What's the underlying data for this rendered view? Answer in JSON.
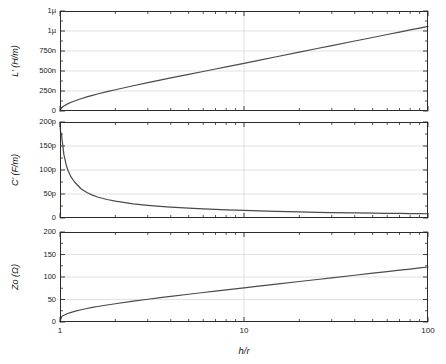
{
  "chart_data": {
    "type": "line",
    "title": "",
    "xlabel": "h/r",
    "xscale": "log",
    "xlim": [
      1,
      100
    ],
    "xticks": [
      1,
      10,
      100
    ],
    "xticklabels": [
      "1",
      "10",
      "100"
    ],
    "grid": true,
    "panels": [
      {
        "id": "panel-inductance",
        "ylabel": "L' (H/m)",
        "ylim": [
          0,
          1.25e-06
        ],
        "yticks": [
          0,
          2.5e-07,
          5e-07,
          7.5e-07,
          1e-06,
          1.25e-06
        ],
        "yticklabels": [
          "0",
          "250n",
          "500n",
          "750n",
          "1µ",
          "1µ"
        ],
        "series": [
          {
            "name": "L'",
            "color": "#4a4a4a",
            "x": [
              1.0,
              1.02,
              1.05,
              1.1,
              1.15,
              1.2,
              1.3,
              1.4,
              1.5,
              1.6,
              1.8,
              2.0,
              2.5,
              3.0,
              3.5,
              4.0,
              5.0,
              6.0,
              7.0,
              8.0,
              10.0,
              12.0,
              15.0,
              20.0,
              25.0,
              30.0,
              40.0,
              50.0,
              60.0,
              70.0,
              80.0,
              90.0,
              100.0
            ],
            "y": [
              0,
              4e-08,
              6.3e-08,
              8.9e-08,
              1.09e-07,
              1.25e-07,
              1.53e-07,
              1.76e-07,
              1.96e-07,
              2.13e-07,
              2.42e-07,
              2.66e-07,
              3.16e-07,
              3.55e-07,
              3.86e-07,
              4.13e-07,
              4.58e-07,
              4.94e-07,
              5.25e-07,
              5.51e-07,
              5.96e-07,
              6.33e-07,
              6.78e-07,
              7.36e-07,
              7.81e-07,
              8.17e-07,
              8.75e-07,
              9.19e-07,
              9.56e-07,
              9.86e-07,
              1.013e-06,
              1.036e-06,
              1.057e-06
            ]
          }
        ]
      },
      {
        "id": "panel-capacitance",
        "ylabel": "C' (F/m)",
        "ylim": [
          0,
          2e-10
        ],
        "yticks": [
          0,
          5e-11,
          1e-10,
          1.5e-10,
          2e-10
        ],
        "yticklabels": [
          "0",
          "50p",
          "100p",
          "150p",
          "200p"
        ],
        "series": [
          {
            "name": "C'",
            "color": "#4a4a4a",
            "x": [
              1.0,
              1.005,
              1.01,
              1.02,
              1.03,
              1.05,
              1.08,
              1.1,
              1.15,
              1.2,
              1.3,
              1.4,
              1.5,
              1.6,
              1.8,
              2.0,
              2.5,
              3.0,
              3.5,
              4.0,
              5.0,
              6.0,
              7.0,
              8.0,
              10.0,
              12.0,
              15.0,
              20.0,
              25.0,
              30.0,
              40.0,
              50.0,
              60.0,
              70.0,
              80.0,
              90.0,
              100.0
            ],
            "y": [
              2e-10,
              1.82e-10,
              1.78e-10,
              1.73e-10,
              1.58e-10,
              1.32e-10,
              1.11e-10,
              1.01e-10,
              8.5e-11,
              7.5e-11,
              6.1e-11,
              5.3e-11,
              4.77e-11,
              4.38e-11,
              3.85e-11,
              3.5e-11,
              2.95e-11,
              2.63e-11,
              2.41e-11,
              2.26e-11,
              2.04e-11,
              1.89e-11,
              1.78e-11,
              1.69e-11,
              1.57e-11,
              1.47e-11,
              1.38e-11,
              1.27e-11,
              1.19e-11,
              1.14e-11,
              1.07e-11,
              1.01e-11,
              9.75e-12,
              9.45e-12,
              9.2e-12,
              9e-12,
              8.82e-12
            ]
          }
        ]
      },
      {
        "id": "panel-impedance",
        "ylabel": "Zo (Ω)",
        "ylim": [
          0,
          200
        ],
        "yticks": [
          0,
          50,
          100,
          150,
          200
        ],
        "yticklabels": [
          "0",
          "50",
          "100",
          "150",
          "200"
        ],
        "series": [
          {
            "name": "Zo",
            "color": "#4a4a4a",
            "x": [
              1.0,
              1.02,
              1.05,
              1.1,
              1.15,
              1.2,
              1.3,
              1.4,
              1.5,
              1.6,
              1.8,
              2.0,
              2.5,
              3.0,
              3.5,
              4.0,
              5.0,
              6.0,
              7.0,
              8.0,
              10.0,
              12.0,
              15.0,
              20.0,
              25.0,
              30.0,
              40.0,
              50.0,
              60.0,
              70.0,
              80.0,
              90.0,
              100.0
            ],
            "y": [
              0,
              12.0,
              15.0,
              18.8,
              21.5,
              23.7,
              27.2,
              30.0,
              32.4,
              34.4,
              37.8,
              40.6,
              46.3,
              50.6,
              54.1,
              57.0,
              61.7,
              65.5,
              68.7,
              71.4,
              75.9,
              79.7,
              84.2,
              90.0,
              94.5,
              98.1,
              103.9,
              108.4,
              112.0,
              115.1,
              117.7,
              120.1,
              122.2
            ]
          }
        ]
      }
    ]
  },
  "figure": {
    "background_color": "#ffffff",
    "line_color": "#4a4a4a",
    "axis_color": "#2b2b2b",
    "grid_color": "#d9d9d9"
  }
}
